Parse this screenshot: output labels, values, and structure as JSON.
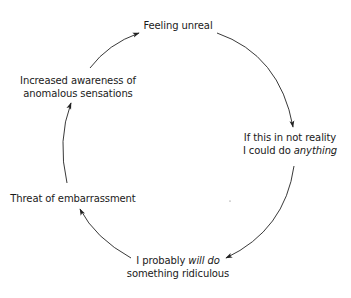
{
  "diagram": {
    "type": "cycle",
    "direction": "clockwise",
    "nodes": [
      {
        "id": "feeling_unreal",
        "lines": [
          "Feeling unreal"
        ]
      },
      {
        "id": "not_reality",
        "lines": [
          "If this in not reality",
          "I could do "
        ],
        "emphasis": "anything"
      },
      {
        "id": "will_do",
        "line1_prefix": "I probably ",
        "line1_emphasis": "will do",
        "line2": "something ridiculous"
      },
      {
        "id": "threat",
        "lines": [
          "Threat of embarrassment"
        ]
      },
      {
        "id": "awareness",
        "lines": [
          "Increased awareness of",
          "anomalous sensations"
        ]
      }
    ],
    "edges": [
      {
        "from": "feeling_unreal",
        "to": "not_reality"
      },
      {
        "from": "not_reality",
        "to": "will_do"
      },
      {
        "from": "will_do",
        "to": "threat"
      },
      {
        "from": "threat",
        "to": "awareness"
      },
      {
        "from": "awareness",
        "to": "feeling_unreal"
      }
    ],
    "colors": {
      "stroke": "#222222",
      "text": "#1a1a1a",
      "background": "#ffffff"
    }
  }
}
